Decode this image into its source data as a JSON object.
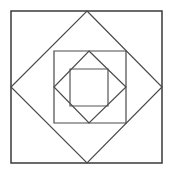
{
  "figure": {
    "title": "Nested squares and diamonds geometric figure",
    "background_color": "#ffffff",
    "canvas": {
      "width": 173,
      "height": 174
    },
    "shapes": [
      {
        "name": "outer-square",
        "kind": "square",
        "stroke_color": "#3a3a3a",
        "stroke_width": 1.5,
        "fill": "none",
        "points": "11,11 162,11 162,163 11,163",
        "bounds": {
          "x": 11,
          "y": 11,
          "width": 151,
          "height": 152
        }
      },
      {
        "name": "outer-diamond",
        "kind": "diamond",
        "stroke_color": "#4a4a4a",
        "stroke_width": 1.2,
        "fill": "none",
        "points": "87,11 162,87 87,163 11,87",
        "bounds": {
          "x": 11,
          "y": 11,
          "width": 151,
          "height": 152
        }
      },
      {
        "name": "middle-square",
        "kind": "square",
        "stroke_color": "#4a4a4a",
        "stroke_width": 1.2,
        "fill": "none",
        "points": "54,51 126,51 126,123 54,123",
        "bounds": {
          "x": 54,
          "y": 51,
          "width": 72,
          "height": 72
        }
      },
      {
        "name": "inner-diamond",
        "kind": "diamond",
        "stroke_color": "#4a4a4a",
        "stroke_width": 1.2,
        "fill": "none",
        "points": "89,51 126,87 89,123 54,87",
        "bounds": {
          "x": 54,
          "y": 51,
          "width": 72,
          "height": 72
        }
      },
      {
        "name": "inner-square",
        "kind": "square",
        "stroke_color": "#555555",
        "stroke_width": 1.2,
        "fill": "none",
        "points": "70,69 108,69 108,106 70,106",
        "bounds": {
          "x": 70,
          "y": 69,
          "width": 38,
          "height": 37
        }
      }
    ]
  }
}
